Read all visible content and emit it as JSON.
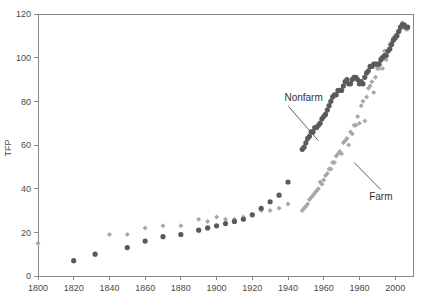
{
  "chart_data": {
    "type": "scatter",
    "title": "",
    "subtitle": "",
    "xlabel": "",
    "ylabel": "TFP",
    "xlim": [
      1800,
      2010
    ],
    "ylim": [
      0,
      120
    ],
    "grid": false,
    "legend_position": "inline-annotations",
    "xticks": [
      "1800",
      "1820",
      "1840",
      "1860",
      "1880",
      "1900",
      "1920",
      "1940",
      "1960",
      "1980",
      "2000"
    ],
    "xtick_values": [
      1800,
      1820,
      1840,
      1860,
      1880,
      1900,
      1920,
      1940,
      1960,
      1980,
      2000
    ],
    "yticks": [
      "0",
      "20",
      "40",
      "60",
      "80",
      "100",
      "120"
    ],
    "ytick_values": [
      0,
      20,
      40,
      60,
      80,
      100,
      120
    ],
    "annotations": [
      {
        "label": "Nonfarm",
        "x_text": 1938,
        "y_text": 80,
        "x_point": 1957,
        "y_point": 62
      },
      {
        "label": "Farm",
        "x_text": 1992,
        "y_text": 35,
        "x_point": 1977,
        "y_point": 52
      }
    ],
    "series": [
      {
        "name": "Nonfarm",
        "marker": "circle",
        "color": "#5a5a5a",
        "points": [
          [
            1820,
            7
          ],
          [
            1832,
            10
          ],
          [
            1850,
            13
          ],
          [
            1860,
            16
          ],
          [
            1870,
            18
          ],
          [
            1880,
            19
          ],
          [
            1890,
            21
          ],
          [
            1895,
            22
          ],
          [
            1900,
            23
          ],
          [
            1905,
            24
          ],
          [
            1910,
            25
          ],
          [
            1915,
            26
          ],
          [
            1920,
            28
          ],
          [
            1925,
            31
          ],
          [
            1930,
            34
          ],
          [
            1935,
            37
          ],
          [
            1940,
            43
          ],
          [
            1948,
            58
          ],
          [
            1949,
            59
          ],
          [
            1950,
            61
          ],
          [
            1951,
            63
          ],
          [
            1952,
            64
          ],
          [
            1953,
            66
          ],
          [
            1954,
            66
          ],
          [
            1955,
            68
          ],
          [
            1956,
            68
          ],
          [
            1957,
            69
          ],
          [
            1958,
            70
          ],
          [
            1959,
            72
          ],
          [
            1960,
            73
          ],
          [
            1961,
            74
          ],
          [
            1962,
            76
          ],
          [
            1963,
            78
          ],
          [
            1964,
            80
          ],
          [
            1965,
            82
          ],
          [
            1966,
            83
          ],
          [
            1967,
            83
          ],
          [
            1968,
            85
          ],
          [
            1969,
            85
          ],
          [
            1970,
            85
          ],
          [
            1971,
            87
          ],
          [
            1972,
            89
          ],
          [
            1973,
            90
          ],
          [
            1974,
            88
          ],
          [
            1975,
            88
          ],
          [
            1976,
            90
          ],
          [
            1977,
            91
          ],
          [
            1978,
            91
          ],
          [
            1979,
            90
          ],
          [
            1980,
            88
          ],
          [
            1981,
            89
          ],
          [
            1982,
            88
          ],
          [
            1983,
            91
          ],
          [
            1984,
            93
          ],
          [
            1985,
            94
          ],
          [
            1986,
            96
          ],
          [
            1987,
            96
          ],
          [
            1988,
            97
          ],
          [
            1989,
            97
          ],
          [
            1990,
            97
          ],
          [
            1991,
            97
          ],
          [
            1992,
            99
          ],
          [
            1993,
            100
          ],
          [
            1994,
            101
          ],
          [
            1995,
            101
          ],
          [
            1996,
            103
          ],
          [
            1997,
            104
          ],
          [
            1998,
            106
          ],
          [
            1999,
            108
          ],
          [
            2000,
            109
          ],
          [
            2001,
            110
          ],
          [
            2002,
            112
          ],
          [
            2003,
            114
          ],
          [
            2004,
            115
          ],
          [
            2005,
            115
          ],
          [
            2006,
            114
          ],
          [
            2007,
            114
          ]
        ]
      },
      {
        "name": "Farm",
        "marker": "diamond",
        "color": "#a8a8a8",
        "points": [
          [
            1800,
            15
          ],
          [
            1840,
            19
          ],
          [
            1850,
            19
          ],
          [
            1860,
            22
          ],
          [
            1870,
            23
          ],
          [
            1880,
            23
          ],
          [
            1890,
            26
          ],
          [
            1895,
            25
          ],
          [
            1900,
            27
          ],
          [
            1905,
            26
          ],
          [
            1910,
            26
          ],
          [
            1915,
            27
          ],
          [
            1920,
            28
          ],
          [
            1925,
            30
          ],
          [
            1930,
            30
          ],
          [
            1935,
            31
          ],
          [
            1940,
            33
          ],
          [
            1948,
            30
          ],
          [
            1949,
            31
          ],
          [
            1950,
            32
          ],
          [
            1951,
            33
          ],
          [
            1952,
            35
          ],
          [
            1953,
            36
          ],
          [
            1954,
            37
          ],
          [
            1955,
            38
          ],
          [
            1956,
            39
          ],
          [
            1957,
            40
          ],
          [
            1958,
            43
          ],
          [
            1959,
            42
          ],
          [
            1960,
            44
          ],
          [
            1961,
            46
          ],
          [
            1962,
            47
          ],
          [
            1963,
            49
          ],
          [
            1964,
            49
          ],
          [
            1965,
            52
          ],
          [
            1966,
            52
          ],
          [
            1967,
            55
          ],
          [
            1968,
            56
          ],
          [
            1969,
            57
          ],
          [
            1970,
            56
          ],
          [
            1971,
            61
          ],
          [
            1972,
            62
          ],
          [
            1973,
            63
          ],
          [
            1974,
            60
          ],
          [
            1975,
            66
          ],
          [
            1976,
            65
          ],
          [
            1977,
            69
          ],
          [
            1978,
            69
          ],
          [
            1979,
            73
          ],
          [
            1980,
            70
          ],
          [
            1981,
            78
          ],
          [
            1982,
            80
          ],
          [
            1983,
            71
          ],
          [
            1984,
            82
          ],
          [
            1985,
            86
          ],
          [
            1986,
            87
          ],
          [
            1987,
            89
          ],
          [
            1988,
            84
          ],
          [
            1989,
            91
          ],
          [
            1990,
            95
          ],
          [
            1991,
            95
          ],
          [
            1992,
            100
          ],
          [
            1993,
            95
          ],
          [
            1994,
            103
          ],
          [
            1995,
            99
          ],
          [
            1996,
            103
          ],
          [
            1997,
            106
          ],
          [
            1998,
            107
          ],
          [
            1999,
            109
          ],
          [
            2000,
            110
          ],
          [
            2001,
            111
          ],
          [
            2002,
            112
          ],
          [
            2003,
            113
          ],
          [
            2004,
            116
          ],
          [
            2005,
            114
          ],
          [
            2006,
            113
          ],
          [
            2007,
            113
          ]
        ]
      }
    ]
  },
  "colors": {
    "nonfarm": "#5a5a5a",
    "farm": "#a8a8a8",
    "axis": "#8a8a8a",
    "text": "#4a4a4a",
    "background": "#ffffff"
  }
}
